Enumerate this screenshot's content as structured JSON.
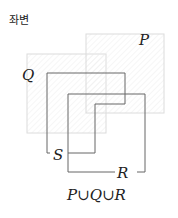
{
  "title": "좌변",
  "diagram": {
    "sets": [
      {
        "name": "P",
        "label": "P",
        "style": "faint-hatched"
      },
      {
        "name": "Q",
        "label": "Q",
        "style": "faint-hatched"
      },
      {
        "name": "R",
        "label": "R",
        "style": "solid"
      },
      {
        "name": "S",
        "label": "S",
        "style": "solid"
      }
    ],
    "caption": "P∪Q∪R"
  },
  "colors": {
    "faint_line": "#d8d8d8",
    "solid_line": "#666666",
    "text": "#222222"
  }
}
